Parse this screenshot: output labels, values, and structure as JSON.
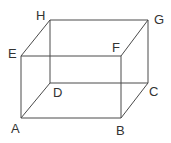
{
  "diagram": {
    "type": "rectangular prism (cuboid) wireframe",
    "stroke_color": "#4a4a4a",
    "label_color": "#333333",
    "vertices": {
      "A": {
        "label": "A",
        "x": 21,
        "y": 118
      },
      "B": {
        "label": "B",
        "x": 121,
        "y": 118
      },
      "C": {
        "label": "C",
        "x": 148,
        "y": 83
      },
      "D": {
        "label": "D",
        "x": 50,
        "y": 83
      },
      "E": {
        "label": "E",
        "x": 21,
        "y": 56
      },
      "F": {
        "label": "F",
        "x": 121,
        "y": 56
      },
      "G": {
        "label": "G",
        "x": 148,
        "y": 20
      },
      "H": {
        "label": "H",
        "x": 50,
        "y": 20
      }
    },
    "edges": [
      [
        "A",
        "B"
      ],
      [
        "B",
        "C"
      ],
      [
        "C",
        "D"
      ],
      [
        "D",
        "A"
      ],
      [
        "E",
        "F"
      ],
      [
        "F",
        "G"
      ],
      [
        "G",
        "H"
      ],
      [
        "H",
        "E"
      ],
      [
        "A",
        "E"
      ],
      [
        "B",
        "F"
      ],
      [
        "C",
        "G"
      ],
      [
        "D",
        "H"
      ]
    ],
    "labels": {
      "A": "A",
      "B": "B",
      "C": "C",
      "D": "D",
      "E": "E",
      "F": "F",
      "G": "G",
      "H": "H"
    }
  }
}
